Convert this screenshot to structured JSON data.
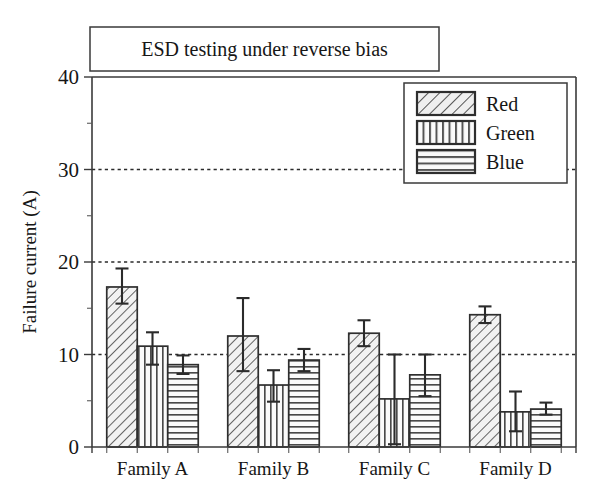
{
  "figure": {
    "title": "ESD testing under reverse bias",
    "background": "#ffffff",
    "ink_color": "#2e2e2e"
  },
  "axes": {
    "ylabel": "Failure current (A)",
    "xlabel": "",
    "y_ticks": [
      "0",
      "10",
      "20",
      "30",
      "40"
    ],
    "x_ticks": [
      "Family A",
      "Family B",
      "Family C",
      "Family D"
    ]
  },
  "legend": {
    "position": "top-right",
    "entries": [
      {
        "label": "Red",
        "pattern": "diagonal-hatch"
      },
      {
        "label": "Green",
        "pattern": "vertical-hatch"
      },
      {
        "label": "Blue",
        "pattern": "horizontal-hatch"
      }
    ]
  },
  "chart_data": {
    "type": "bar",
    "title": "ESD testing under reverse bias",
    "xlabel": "",
    "ylabel": "Failure current (A)",
    "ylim": [
      0,
      40
    ],
    "ytick_values": [
      0,
      10,
      20,
      30,
      40
    ],
    "yminor_tick_values": [
      5,
      15,
      25,
      35
    ],
    "grid": true,
    "gridlines_at": [
      10,
      20,
      30
    ],
    "grid_style": "dotted",
    "legend_position": "upper right",
    "categories": [
      "Family A",
      "Family B",
      "Family C",
      "Family D"
    ],
    "series": [
      {
        "name": "Red",
        "pattern": "diagonal-hatch",
        "values": [
          17.3,
          12.0,
          12.3,
          14.3
        ],
        "err_upper": [
          2.0,
          4.1,
          1.4,
          0.9
        ],
        "err_lower": [
          1.8,
          3.8,
          1.4,
          0.9
        ]
      },
      {
        "name": "Green",
        "pattern": "vertical-hatch",
        "values": [
          10.9,
          6.7,
          5.2,
          3.8
        ],
        "err_upper": [
          1.5,
          1.6,
          4.8,
          2.2
        ],
        "err_lower": [
          2.0,
          1.8,
          4.9,
          2.1
        ]
      },
      {
        "name": "Blue",
        "pattern": "horizontal-hatch",
        "values": [
          8.9,
          9.4,
          7.8,
          4.1
        ],
        "err_upper": [
          1.0,
          1.2,
          2.2,
          0.7
        ],
        "err_lower": [
          1.0,
          1.2,
          2.3,
          0.6
        ]
      }
    ]
  }
}
